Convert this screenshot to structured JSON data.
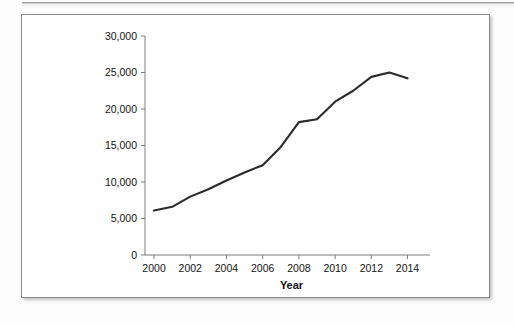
{
  "page": {
    "background_color": "#fdfdfd",
    "card_border_color": "#8a8a8a",
    "rule_color": "#8e8e8e"
  },
  "chart_data": {
    "type": "line",
    "title": "",
    "subtitle": "",
    "xlabel": "Year",
    "ylabel": "",
    "x": [
      2000,
      2001,
      2002,
      2003,
      2004,
      2005,
      2006,
      2007,
      2008,
      2009,
      2010,
      2011,
      2012,
      2013,
      2014
    ],
    "values": [
      6100,
      6600,
      8000,
      9000,
      10200,
      11300,
      12300,
      14800,
      18200,
      18600,
      21000,
      22500,
      24400,
      25000,
      24200
    ],
    "series": [
      {
        "name": "",
        "color": "#2b2b2b",
        "values": [
          6100,
          6600,
          8000,
          9000,
          10200,
          11300,
          12300,
          14800,
          18200,
          18600,
          21000,
          22500,
          24400,
          25000,
          24200
        ]
      }
    ],
    "xlim": [
      1999.5,
      2014.8
    ],
    "ylim": [
      0,
      30000
    ],
    "x_tick_labels": [
      "2000",
      "2002",
      "2004",
      "2006",
      "2008",
      "2010",
      "2012",
      "2014"
    ],
    "x_tick_values": [
      2000,
      2002,
      2004,
      2006,
      2008,
      2010,
      2012,
      2014
    ],
    "y_tick_labels": [
      "0",
      "5,000",
      "10,000",
      "15,000",
      "20,000",
      "25,000",
      "30,000"
    ],
    "y_tick_values": [
      0,
      5000,
      10000,
      15000,
      20000,
      25000,
      30000
    ],
    "grid": false,
    "legend": false,
    "legend_position": "none",
    "markers": false,
    "annotations": []
  }
}
